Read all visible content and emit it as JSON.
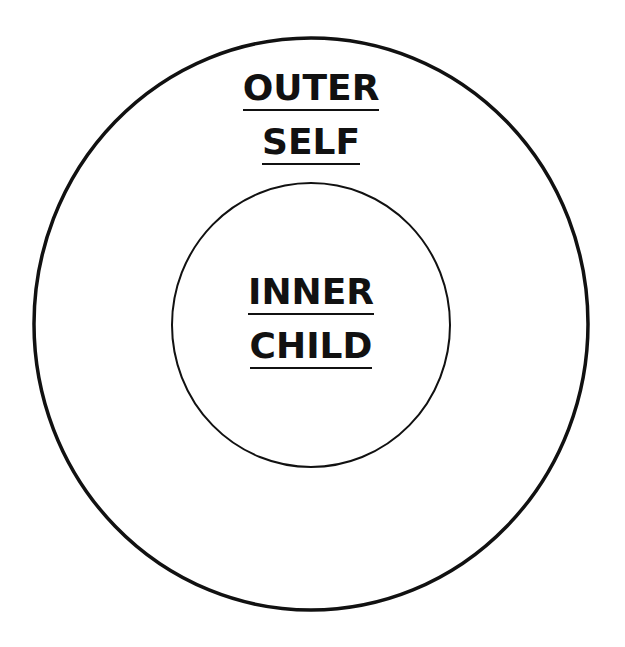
{
  "diagram": {
    "outer": {
      "label_line1": "OUTER",
      "label_line2": "SELF"
    },
    "inner": {
      "label_line1": "INNER",
      "label_line2": "CHILD"
    },
    "colors": {
      "stroke": "#111111",
      "background": "#ffffff"
    }
  }
}
